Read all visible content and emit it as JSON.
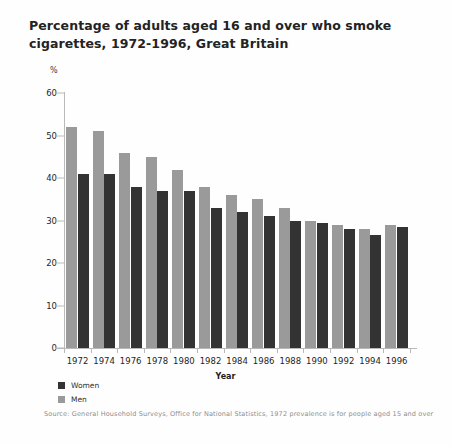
{
  "title": "Percentage of adults aged 16 and over who smoke cigarettes, 1972-1996, Great Britain",
  "axis_unit_label": "%",
  "xaxis_title": "Year",
  "legend": {
    "women_label": "Women",
    "men_label": "Men"
  },
  "source_note": "Source: General Household Surveys, Office for National Statistics, 1972 prevalence is for people aged 15 and over",
  "colors": {
    "women": "#333333",
    "men": "#9a9a9a",
    "axis": "#b9b9b9",
    "text": "#232323",
    "source_text": "#8d8d8d"
  },
  "chart_data": {
    "type": "bar",
    "title": "Percentage of adults aged 16 and over who smoke cigarettes, 1972-1996, Great Britain",
    "xlabel": "Year",
    "ylabel": "%",
    "ylim": [
      0,
      60
    ],
    "yticks": [
      0,
      10,
      20,
      30,
      40,
      50,
      60
    ],
    "grid": false,
    "legend_position": "below-left",
    "categories": [
      "1972",
      "1974",
      "1976",
      "1978",
      "1980",
      "1982",
      "1984",
      "1986",
      "1988",
      "1990",
      "1992",
      "1994",
      "1996"
    ],
    "series": [
      {
        "name": "Men",
        "color": "#9a9a9a",
        "values": [
          52,
          51,
          46,
          45,
          42,
          38,
          36,
          35,
          33,
          30,
          29,
          28,
          29
        ]
      },
      {
        "name": "Women",
        "color": "#333333",
        "values": [
          41,
          41,
          38,
          37,
          37,
          33,
          32,
          31,
          30,
          29.5,
          28,
          26.5,
          28.5
        ]
      }
    ],
    "annotations": [
      "1972 prevalence is for people aged 15 and over"
    ]
  }
}
